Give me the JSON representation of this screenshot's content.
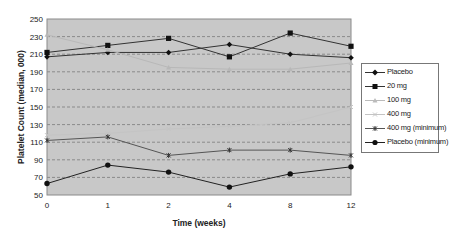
{
  "chart_data": {
    "type": "line",
    "title": "",
    "xlabel": "Time (weeks)",
    "ylabel": "Platelet Count (median, 000)",
    "categories": [
      "0",
      "1",
      "2",
      "4",
      "8",
      "12"
    ],
    "ylim": [
      50,
      250
    ],
    "yticks": [
      250,
      230,
      210,
      190,
      170,
      150,
      130,
      110,
      90,
      70,
      50
    ],
    "grid": "horizontal dashed",
    "legend_position": "right",
    "series": [
      {
        "name": "Placebo",
        "marker": "diamond",
        "color": "#333333",
        "values": [
          207,
          212,
          212,
          221,
          210,
          206
        ]
      },
      {
        "name": "20 mg",
        "marker": "square",
        "color": "#333333",
        "values": [
          212,
          220,
          228,
          207,
          234,
          219
        ]
      },
      {
        "name": "100 mg",
        "marker": "triangle",
        "color": "#b8b8b8",
        "values": [
          232,
          215,
          195,
          193,
          193,
          200
        ]
      },
      {
        "name": "400 mg",
        "marker": "x",
        "color": "#c4c4c4",
        "values": [
          118,
          120,
          125,
          128,
          132,
          150
        ]
      },
      {
        "name": "400 mg (minimum)",
        "marker": "asterisk",
        "color": "#555555",
        "values": [
          112,
          116,
          95,
          101,
          101,
          95
        ]
      },
      {
        "name": "Placebo (minimum)",
        "marker": "circle",
        "color": "#222222",
        "values": [
          63,
          84,
          76,
          59,
          74,
          82
        ]
      }
    ]
  },
  "legend": {
    "items": [
      {
        "label": "Placebo"
      },
      {
        "label": "20 mg"
      },
      {
        "label": "100 mg"
      },
      {
        "label": "400 mg"
      },
      {
        "label": "400 mg (minimum)"
      },
      {
        "label": "Placebo (minimum)"
      }
    ]
  },
  "colors": {
    "plot_background": "#c8c8c8",
    "gridline": "#8a8a8a"
  }
}
